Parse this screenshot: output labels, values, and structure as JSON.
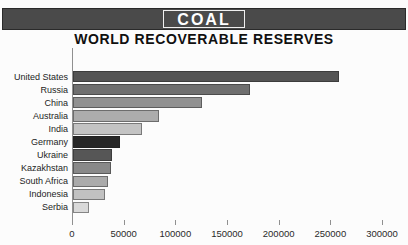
{
  "header": {
    "title": "COAL",
    "subtitle": "WORLD RECOVERABLE RESERVES"
  },
  "chart_data": {
    "type": "bar",
    "orientation": "horizontal",
    "title": "COAL",
    "subtitle": "WORLD RECOVERABLE RESERVES",
    "categories": [
      "United States",
      "Russia",
      "China",
      "Australia",
      "India",
      "Germany",
      "Ukraine",
      "Kazakhstan",
      "South Africa",
      "Indonesia",
      "Serbia"
    ],
    "values": [
      257000,
      171000,
      125000,
      83500,
      67000,
      45000,
      37500,
      37000,
      33500,
      30500,
      15500
    ],
    "bar_colors": [
      "#545454",
      "#6f6f6f",
      "#919191",
      "#acacac",
      "#c3c3c3",
      "#262626",
      "#565656",
      "#898989",
      "#ababab",
      "#c1c1c1",
      "#d9d9d9"
    ],
    "xlabel": "",
    "ylabel": "",
    "xlim": [
      0,
      300000
    ],
    "x_ticks": [
      0,
      50000,
      100000,
      150000,
      200000,
      250000,
      300000
    ],
    "x_tick_labels": [
      "0",
      "50000",
      "100000",
      "150000",
      "200000",
      "250000",
      "300000"
    ],
    "grid": false,
    "legend": "none"
  },
  "colors": {
    "page_bg": "#fcfcfc",
    "header_bg": "#4a4a4a",
    "header_border": "#2a2a2a",
    "title_text": "#ffffff",
    "title_box_border": "#f0f0f0",
    "subtitle_text": "#101010",
    "axis_color": "#909090",
    "label_text": "#1c1c1c",
    "tick_text": "#2a2a2a",
    "bar_border": "rgba(30,30,30,0.45)"
  }
}
